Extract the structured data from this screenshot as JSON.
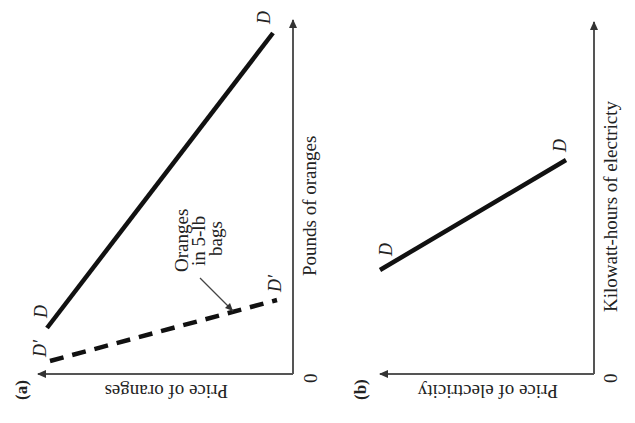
{
  "panels": [
    {
      "id": "a",
      "tag": "(a)",
      "x_axis_label": "Price of oranges",
      "y_axis_label": "Pounds of oranges",
      "origin_label": "0",
      "curves": [
        {
          "name": "D",
          "style": "solid",
          "label_start": "D",
          "label_end": "D"
        },
        {
          "name": "D'",
          "style": "dashed",
          "label_start": "D′",
          "label_end": "D′"
        }
      ],
      "annotation": {
        "lines": [
          "Oranges",
          "in 5-lb",
          "bags"
        ]
      }
    },
    {
      "id": "b",
      "tag": "(b)",
      "x_axis_label": "Price of electricity",
      "y_axis_label": "Kilowatt-hours of electricty",
      "origin_label": "0",
      "curves": [
        {
          "name": "D",
          "style": "solid",
          "label_start": "D",
          "label_end": "D"
        }
      ]
    }
  ],
  "colors": {
    "line": "#111111",
    "axis": "#555555",
    "background": "#ffffff"
  }
}
